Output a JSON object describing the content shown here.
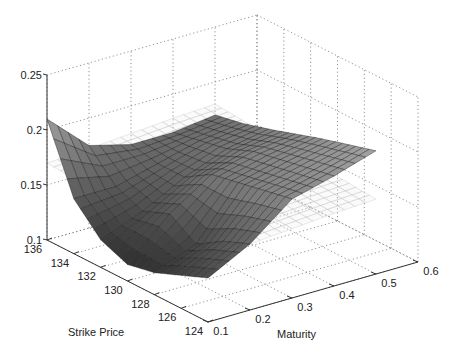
{
  "chart_data": {
    "type": "surface3d",
    "title": "",
    "xlabel": "Strike Price",
    "ylabel": "Maturity",
    "zlabel": "",
    "x_axis": {
      "name": "Strike Price",
      "range": [
        124,
        136
      ],
      "ticks": [
        136,
        134,
        132,
        130,
        128,
        126,
        124
      ]
    },
    "y_axis": {
      "name": "Maturity",
      "range": [
        0.1,
        0.6
      ],
      "ticks": [
        0.1,
        0.2,
        0.3,
        0.4,
        0.5,
        0.6
      ]
    },
    "z_axis": {
      "name": "Implied Volatility",
      "range": [
        0.1,
        0.25
      ],
      "ticks": [
        0.1,
        0.15,
        0.2,
        0.25
      ]
    },
    "grid": true,
    "series": [
      {
        "name": "Estimated volatility surface (dark)",
        "style": "shaded mesh",
        "strike": [
          136,
          134,
          132,
          130,
          128,
          126,
          124
        ],
        "maturity": [
          0.1,
          0.2,
          0.3,
          0.4,
          0.5
        ],
        "values": [
          [
            0.21,
            0.175,
            0.165,
            0.165,
            0.17
          ],
          [
            0.15,
            0.15,
            0.16,
            0.17,
            0.175
          ],
          [
            0.125,
            0.14,
            0.16,
            0.175,
            0.182
          ],
          [
            0.115,
            0.15,
            0.175,
            0.185,
            0.19
          ],
          [
            0.12,
            0.135,
            0.18,
            0.19,
            0.198
          ],
          [
            0.13,
            0.15,
            0.185,
            0.195,
            0.205
          ],
          [
            0.14,
            0.16,
            0.19,
            0.2,
            0.212
          ]
        ]
      },
      {
        "name": "Reference surface (light wireframe)",
        "style": "light wire mesh",
        "strike": [
          136,
          134,
          132,
          130,
          128,
          126,
          124
        ],
        "maturity": [
          0.1,
          0.2,
          0.3,
          0.4,
          0.5
        ],
        "values": [
          [
            0.17,
            0.172,
            0.175,
            0.178,
            0.18
          ],
          [
            0.168,
            0.17,
            0.173,
            0.176,
            0.178
          ],
          [
            0.166,
            0.168,
            0.171,
            0.174,
            0.176
          ],
          [
            0.164,
            0.166,
            0.169,
            0.172,
            0.174
          ],
          [
            0.162,
            0.164,
            0.167,
            0.17,
            0.172
          ],
          [
            0.16,
            0.162,
            0.165,
            0.168,
            0.17
          ],
          [
            0.158,
            0.16,
            0.163,
            0.166,
            0.168
          ]
        ]
      }
    ],
    "colors": {
      "surface_dark": "#222222",
      "surface_light": "#bdbdbd",
      "grid": "#777777",
      "axis": "#333333"
    }
  }
}
